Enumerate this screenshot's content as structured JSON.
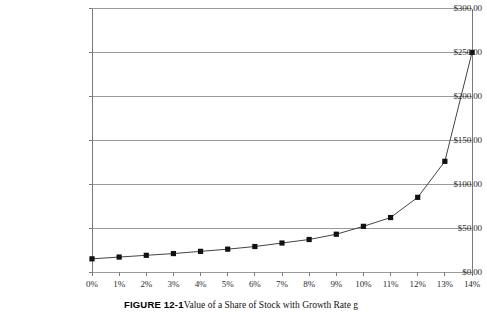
{
  "caption": {
    "label": "FIGURE 12-1",
    "text": "Value of a Share of Stock with Growth Rate g"
  },
  "chart_data": {
    "type": "line",
    "title": "",
    "xlabel": "",
    "ylabel": "",
    "x": [
      "0%",
      "1%",
      "2%",
      "3%",
      "4%",
      "5%",
      "6%",
      "7%",
      "8%",
      "9%",
      "10%",
      "11%",
      "12%",
      "13%",
      "14%"
    ],
    "values": [
      15.0,
      17.0,
      19.0,
      21.0,
      23.5,
      26.0,
      29.0,
      33.0,
      37.0,
      43.0,
      52.0,
      62.0,
      85.0,
      126.0,
      250.0
    ],
    "series": [
      {
        "name": "Share Value",
        "values": [
          15.0,
          17.0,
          19.0,
          21.0,
          23.5,
          26.0,
          29.0,
          33.0,
          37.0,
          43.0,
          52.0,
          62.0,
          85.0,
          126.0,
          250.0
        ]
      }
    ],
    "ylim": [
      0,
      300
    ],
    "yticks": [
      0,
      50,
      100,
      150,
      200,
      250,
      300
    ],
    "ytick_labels": [
      "$0.00",
      "$50.00",
      "$100.00",
      "$150.00",
      "$200.00",
      "$250.00",
      "$300.00"
    ],
    "xticks": [
      "0%",
      "1%",
      "2%",
      "3%",
      "4%",
      "5%",
      "6%",
      "7%",
      "8%",
      "9%",
      "10%",
      "11%",
      "12%",
      "13%",
      "14%"
    ],
    "grid": "horizontal",
    "legend": "none",
    "marker": "square",
    "marker_color": "#111111",
    "line_color": "#444444",
    "gridline_color": "#999999",
    "axis_color": "#7a7a7a",
    "background": "#ffffff"
  }
}
